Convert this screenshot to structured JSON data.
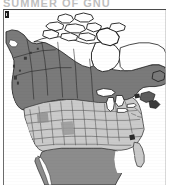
{
  "figure": {
    "kind": "distribution-range-map",
    "clipped_caption_top": "SUMMER OF GNU",
    "corner_mark_label": "scan-registration-mark"
  },
  "map": {
    "title": "North America range map",
    "projection_note": "conic, continental North America",
    "frame": {
      "border_color": "#4a4a4a",
      "background_color": "#ffffff"
    },
    "regions": [
      {
        "id": "arctic-canada",
        "label": "Arctic Canada and Canadian Arctic Archipelago",
        "fill": "#ffffff",
        "stroke": "#1a1a1a",
        "shading_class": "outside-range"
      },
      {
        "id": "boreal-band",
        "label": "Boreal and northern range band",
        "fill": "#7a7a7a",
        "stroke": "#1a1a1a",
        "shading_class": "breeding-range"
      },
      {
        "id": "conterminous-us",
        "label": "Conterminous United States",
        "fill": "#cacaca",
        "stroke": "#3c3c3c",
        "shading_class": "wintering-range"
      },
      {
        "id": "mexico",
        "label": "Mexico",
        "fill": "#8c8c8c",
        "stroke": "#2a2a2a",
        "shading_class": "wintering-range"
      },
      {
        "id": "great-lakes",
        "label": "Great Lakes",
        "fill": "#ffffff",
        "stroke": "#1a1a1a",
        "shading_class": "water"
      },
      {
        "id": "hudson-bay",
        "label": "Hudson Bay",
        "fill": "#ffffff",
        "stroke": "#1a1a1a",
        "shading_class": "water"
      }
    ],
    "colors": {
      "dark_gray": "#7a7a7a",
      "darker_gray": "#6a6a6a",
      "mid_gray": "#8c8c8c",
      "light_gray": "#cacaca",
      "outline": "#1a1a1a",
      "state_border": "#3c3c3c",
      "white": "#ffffff",
      "frame_border": "#4a4a4a",
      "accent_black": "#1e1e1e"
    },
    "features": {
      "state_borders_visible": true,
      "province_borders_visible": true,
      "coastline_visible": true,
      "graticule_visible": false,
      "labels_visible": false,
      "scale_bar_visible": false,
      "legend_visible": false
    },
    "notes": "No textual labels, legend, scale bar, or gridlines are rendered inside the map frame; shading alone encodes range."
  }
}
